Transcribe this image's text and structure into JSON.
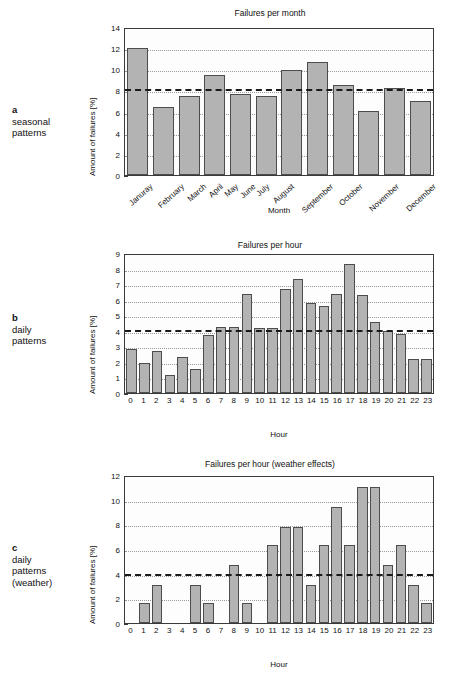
{
  "figure": {
    "panels": [
      {
        "id": "a",
        "tag": "a",
        "caption_lines": [
          "seasonal",
          "patterns"
        ],
        "chart_data": {
          "type": "bar",
          "title": "Failures per month",
          "xlabel": "Month",
          "ylabel": "Amount of failures [%]",
          "categories": [
            "Januray",
            "February",
            "March",
            "April",
            "May",
            "June",
            "July",
            "August",
            "September",
            "October",
            "November",
            "December"
          ],
          "values": [
            12.0,
            6.4,
            7.5,
            9.5,
            7.65,
            7.5,
            9.95,
            10.7,
            8.55,
            6.05,
            8.25,
            7.0
          ],
          "ylim": [
            0,
            14
          ],
          "yticks": [
            0,
            2,
            4,
            6,
            8,
            10,
            12,
            14
          ],
          "grid": true,
          "mean_line": 8.3,
          "bar_color": "#b3b3b3",
          "bar_edge_color": "#4d4d4d",
          "mean_line_color": "#1a1a1a",
          "tick_label_rotation": -42
        }
      },
      {
        "id": "b",
        "tag": "b",
        "caption_lines": [
          "daily",
          "patterns"
        ],
        "chart_data": {
          "type": "bar",
          "title": "Failures per hour",
          "xlabel": "Hour",
          "ylabel": "Amount of failures [%]",
          "categories": [
            "0",
            "1",
            "2",
            "3",
            "4",
            "5",
            "6",
            "7",
            "8",
            "9",
            "10",
            "11",
            "12",
            "13",
            "14",
            "15",
            "16",
            "17",
            "18",
            "19",
            "20",
            "21",
            "22",
            "23"
          ],
          "values": [
            2.85,
            1.95,
            2.7,
            1.15,
            2.3,
            1.55,
            3.75,
            4.25,
            4.25,
            6.35,
            4.15,
            4.15,
            6.7,
            7.3,
            5.8,
            5.6,
            6.35,
            8.3,
            6.3,
            4.55,
            4.0,
            3.8,
            2.2,
            2.2
          ],
          "ylim": [
            0,
            9
          ],
          "yticks": [
            0,
            1,
            2,
            3,
            4,
            5,
            6,
            7,
            8,
            9
          ],
          "grid": true,
          "mean_line": 4.2,
          "bar_color": "#b3b3b3",
          "bar_edge_color": "#4d4d4d",
          "mean_line_color": "#1a1a1a",
          "tick_label_rotation": 0
        }
      },
      {
        "id": "c",
        "tag": "c",
        "caption_lines": [
          "daily",
          "patterns",
          "(weather)"
        ],
        "chart_data": {
          "type": "bar",
          "title": "Failures per hour (weather effects)",
          "xlabel": "Hour",
          "ylabel": "Amount of failures [%]",
          "categories": [
            "0",
            "1",
            "2",
            "3",
            "4",
            "5",
            "6",
            "7",
            "8",
            "9",
            "10",
            "11",
            "12",
            "13",
            "14",
            "15",
            "16",
            "17",
            "18",
            "19",
            "20",
            "21",
            "22",
            "23"
          ],
          "values": [
            0,
            1.6,
            3.1,
            0,
            0,
            3.1,
            1.6,
            0,
            4.7,
            1.6,
            0,
            6.3,
            7.8,
            7.8,
            3.1,
            6.3,
            9.4,
            6.3,
            11.0,
            11.0,
            4.7,
            6.3,
            3.1,
            1.6
          ],
          "ylim": [
            0,
            12
          ],
          "yticks": [
            0,
            2,
            4,
            6,
            8,
            10,
            12
          ],
          "grid": true,
          "mean_line": 4.15,
          "bar_color": "#b3b3b3",
          "bar_edge_color": "#4d4d4d",
          "mean_line_color": "#1a1a1a",
          "tick_label_rotation": 0
        }
      }
    ]
  }
}
